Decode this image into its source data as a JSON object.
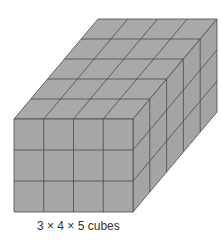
{
  "figure": {
    "caption": "3 × 4 × 5 cubes",
    "dimensions": {
      "height": 3,
      "width": 4,
      "depth": 5
    },
    "colors": {
      "face": "#a7a7a7",
      "top": "#a9a9a9",
      "side": "#a4a4a4",
      "line": "#4a4a4a"
    }
  }
}
